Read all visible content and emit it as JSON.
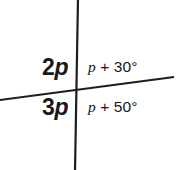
{
  "figure": {
    "kind": "intersecting-lines-angle-diagram",
    "background_color": "#ffffff",
    "stroke_color": "#1b1d21",
    "width": 178,
    "height": 170
  },
  "lines": {
    "vertical": {
      "name": "vertical-line",
      "x1": 78,
      "y1": 0,
      "x2": 75,
      "y2": 170,
      "stroke_width": 2.2
    },
    "transversal": {
      "name": "slanted-line",
      "x1": 0,
      "y1": 100,
      "x2": 173,
      "y2": 77,
      "stroke_width": 2.0
    },
    "intersection": {
      "x": 78,
      "y": 89
    }
  },
  "labels": {
    "top_left": {
      "coefficient": "2",
      "variable": "p",
      "text": "2p"
    },
    "bottom_left": {
      "coefficient": "3",
      "variable": "p",
      "text": "3p"
    },
    "top_right": {
      "variable": "p",
      "operator": "+",
      "constant": "30",
      "unit": "°",
      "text": "p + 30°"
    },
    "bottom_right": {
      "variable": "p",
      "operator": "+",
      "constant": "50",
      "unit": "°",
      "text": "p + 50°"
    }
  }
}
